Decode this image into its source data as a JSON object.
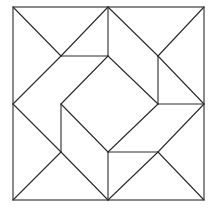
{
  "diagram": {
    "type": "geometric-tiling",
    "stroke_color": "#2a2a2a",
    "background_color": "#ffffff",
    "grid": {
      "x": [
        13,
        61,
        108,
        158,
        204
      ],
      "y": [
        7,
        56,
        104,
        152,
        200
      ]
    },
    "outer_square": {
      "x": 13,
      "y": 7,
      "width": 191,
      "height": 193
    },
    "segments": [
      [
        13,
        7,
        61,
        56
      ],
      [
        108,
        7,
        61,
        56
      ],
      [
        61,
        56,
        108,
        56
      ],
      [
        61,
        56,
        13,
        104
      ],
      [
        108,
        56,
        61,
        104
      ],
      [
        108,
        7,
        108,
        56
      ],
      [
        108,
        7,
        158,
        56
      ],
      [
        204,
        7,
        158,
        56
      ],
      [
        158,
        56,
        204,
        104
      ],
      [
        158,
        56,
        158,
        104
      ],
      [
        108,
        56,
        158,
        104
      ],
      [
        158,
        104,
        204,
        104
      ],
      [
        204,
        104,
        158,
        152
      ],
      [
        158,
        104,
        108,
        152
      ],
      [
        158,
        152,
        204,
        200
      ],
      [
        158,
        152,
        108,
        200
      ],
      [
        108,
        152,
        158,
        152
      ],
      [
        108,
        152,
        108,
        200
      ],
      [
        108,
        200,
        61,
        152
      ],
      [
        13,
        200,
        61,
        152
      ],
      [
        61,
        152,
        13,
        104
      ],
      [
        61,
        152,
        61,
        104
      ],
      [
        61,
        104,
        108,
        152
      ]
    ]
  }
}
